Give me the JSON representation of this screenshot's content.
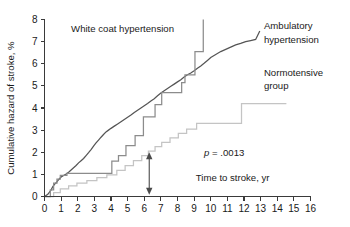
{
  "chart_data": {
    "type": "line",
    "title": "",
    "xlabel": "Time to stroke, yr",
    "ylabel": "Cumulative hazard of stroke, %",
    "xlim": [
      0,
      16
    ],
    "ylim": [
      0,
      8
    ],
    "xticks": [
      "0",
      "1",
      "2",
      "3",
      "4",
      "5",
      "6",
      "7",
      "8",
      "9",
      "10",
      "11",
      "12",
      "13",
      "14",
      "15",
      "16"
    ],
    "yticks": [
      "0",
      "1",
      "2",
      "3",
      "4",
      "5",
      "6",
      "7",
      "8"
    ],
    "grid": false,
    "legend_position": "inline-annotations",
    "annotations": [
      {
        "name": "p-value",
        "text_italic": "p",
        "text": " = .0013",
        "x": 9.6,
        "y": 1.85
      },
      {
        "name": "arrow",
        "label": "difference-arrow",
        "x": 6.3,
        "y_low": 0.08,
        "y_high": 2.0
      }
    ],
    "series": [
      {
        "name": "Ambulatory hypertension",
        "color": "#555555",
        "label_x": 13.3,
        "label_y": 7.6,
        "points": [
          [
            0.0,
            0.0
          ],
          [
            0.2,
            0.1
          ],
          [
            0.3,
            0.2
          ],
          [
            0.4,
            0.3
          ],
          [
            0.5,
            0.45
          ],
          [
            0.6,
            0.55
          ],
          [
            0.7,
            0.62
          ],
          [
            0.8,
            0.72
          ],
          [
            0.9,
            0.8
          ],
          [
            1.0,
            0.88
          ],
          [
            1.15,
            0.95
          ],
          [
            1.3,
            1.02
          ],
          [
            1.45,
            1.1
          ],
          [
            1.6,
            1.2
          ],
          [
            1.75,
            1.3
          ],
          [
            1.9,
            1.4
          ],
          [
            2.05,
            1.52
          ],
          [
            2.2,
            1.62
          ],
          [
            2.35,
            1.72
          ],
          [
            2.5,
            1.85
          ],
          [
            2.65,
            1.98
          ],
          [
            2.8,
            2.12
          ],
          [
            2.95,
            2.28
          ],
          [
            3.1,
            2.42
          ],
          [
            3.25,
            2.55
          ],
          [
            3.4,
            2.68
          ],
          [
            3.55,
            2.8
          ],
          [
            3.7,
            2.92
          ],
          [
            3.85,
            3.0
          ],
          [
            4.0,
            3.08
          ],
          [
            4.2,
            3.18
          ],
          [
            4.4,
            3.28
          ],
          [
            4.6,
            3.38
          ],
          [
            4.8,
            3.48
          ],
          [
            5.0,
            3.58
          ],
          [
            5.2,
            3.68
          ],
          [
            5.4,
            3.8
          ],
          [
            5.6,
            3.9
          ],
          [
            5.8,
            4.0
          ],
          [
            6.0,
            4.1
          ],
          [
            6.2,
            4.2
          ],
          [
            6.4,
            4.32
          ],
          [
            6.6,
            4.42
          ],
          [
            6.8,
            4.55
          ],
          [
            7.0,
            4.68
          ],
          [
            7.2,
            4.78
          ],
          [
            7.4,
            4.88
          ],
          [
            7.6,
            4.98
          ],
          [
            7.8,
            5.08
          ],
          [
            8.0,
            5.18
          ],
          [
            8.2,
            5.28
          ],
          [
            8.4,
            5.4
          ],
          [
            8.6,
            5.5
          ],
          [
            8.8,
            5.58
          ],
          [
            9.0,
            5.68
          ],
          [
            9.2,
            5.8
          ],
          [
            9.4,
            5.9
          ],
          [
            9.6,
            6.02
          ],
          [
            9.8,
            6.15
          ],
          [
            10.0,
            6.28
          ],
          [
            10.3,
            6.42
          ],
          [
            10.6,
            6.55
          ],
          [
            10.9,
            6.65
          ],
          [
            11.2,
            6.75
          ],
          [
            11.5,
            6.85
          ],
          [
            11.8,
            6.92
          ],
          [
            12.1,
            7.0
          ],
          [
            12.4,
            7.05
          ],
          [
            12.7,
            7.1
          ],
          [
            12.95,
            7.48
          ]
        ]
      },
      {
        "name": "White coat hypertension",
        "color": "#8c8c8c",
        "label_x": 2.2,
        "label_y": 7.55,
        "points": [
          [
            0.0,
            0.0
          ],
          [
            0.35,
            0.0
          ],
          [
            0.35,
            0.3
          ],
          [
            0.55,
            0.3
          ],
          [
            0.55,
            0.6
          ],
          [
            0.75,
            0.6
          ],
          [
            0.75,
            0.78
          ],
          [
            0.95,
            0.78
          ],
          [
            0.95,
            0.95
          ],
          [
            1.35,
            0.95
          ],
          [
            1.35,
            1.05
          ],
          [
            4.05,
            1.05
          ],
          [
            4.05,
            1.6
          ],
          [
            4.45,
            1.6
          ],
          [
            4.45,
            1.85
          ],
          [
            4.9,
            1.85
          ],
          [
            4.9,
            2.3
          ],
          [
            5.45,
            2.3
          ],
          [
            5.45,
            2.75
          ],
          [
            5.95,
            2.75
          ],
          [
            5.95,
            3.6
          ],
          [
            6.65,
            3.6
          ],
          [
            6.65,
            4.15
          ],
          [
            7.05,
            4.15
          ],
          [
            7.05,
            4.7
          ],
          [
            8.25,
            4.7
          ],
          [
            8.25,
            5.15
          ],
          [
            8.45,
            5.15
          ],
          [
            8.45,
            5.5
          ],
          [
            9.05,
            5.5
          ],
          [
            9.05,
            6.55
          ],
          [
            9.55,
            6.55
          ],
          [
            9.55,
            8.0
          ]
        ]
      },
      {
        "name": "Normotensive group",
        "color": "#c4c4c4",
        "label_x": 13.3,
        "label_y": 5.55,
        "points": [
          [
            0.0,
            0.0
          ],
          [
            0.55,
            0.0
          ],
          [
            0.55,
            0.18
          ],
          [
            0.95,
            0.18
          ],
          [
            0.95,
            0.35
          ],
          [
            1.45,
            0.35
          ],
          [
            1.45,
            0.48
          ],
          [
            1.95,
            0.48
          ],
          [
            1.95,
            0.6
          ],
          [
            2.55,
            0.6
          ],
          [
            2.55,
            0.72
          ],
          [
            3.15,
            0.72
          ],
          [
            3.15,
            0.85
          ],
          [
            3.75,
            0.85
          ],
          [
            3.75,
            0.98
          ],
          [
            4.35,
            0.98
          ],
          [
            4.35,
            1.18
          ],
          [
            4.85,
            1.18
          ],
          [
            4.85,
            1.4
          ],
          [
            5.35,
            1.4
          ],
          [
            5.35,
            1.62
          ],
          [
            5.85,
            1.62
          ],
          [
            5.85,
            1.85
          ],
          [
            6.25,
            1.85
          ],
          [
            6.25,
            2.05
          ],
          [
            6.65,
            2.05
          ],
          [
            6.65,
            2.25
          ],
          [
            7.05,
            2.25
          ],
          [
            7.05,
            2.45
          ],
          [
            7.55,
            2.45
          ],
          [
            7.55,
            2.65
          ],
          [
            8.05,
            2.65
          ],
          [
            8.05,
            2.85
          ],
          [
            8.55,
            2.85
          ],
          [
            8.55,
            3.05
          ],
          [
            9.15,
            3.05
          ],
          [
            9.15,
            3.3
          ],
          [
            11.85,
            3.3
          ],
          [
            11.85,
            4.2
          ],
          [
            14.55,
            4.2
          ]
        ]
      }
    ]
  },
  "axes": {
    "x_title": "Time to stroke, yr",
    "y_title": "Cumulative hazard of stroke, %"
  },
  "labels": {
    "white_coat": "White coat hypertension",
    "ambulatory_line1": "Ambulatory",
    "ambulatory_line2": "hypertension",
    "normotensive_line1": "Normotensive",
    "normotensive_line2": "group",
    "p_italic": "p",
    "p_rest": " = .0013"
  },
  "colors": {
    "ambulatory": "#555555",
    "white_coat": "#8c8c8c",
    "normotensive": "#c4c4c4",
    "axis": "#3a3a3a",
    "text": "#1a1a1a",
    "background": "#ffffff"
  }
}
